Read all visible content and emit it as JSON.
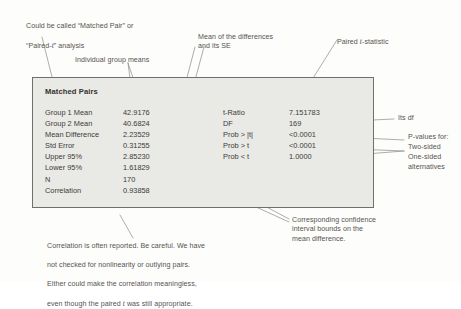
{
  "figure": {
    "box_title": "Matched Pairs",
    "left_table": {
      "rows": [
        {
          "label": "Group 1 Mean",
          "value": "42.9176"
        },
        {
          "label": "Group 2 Mean",
          "value": "40.6824"
        },
        {
          "label": "Mean Difference",
          "value": "2.23529"
        },
        {
          "label": "Std Error",
          "value": "0.31255"
        },
        {
          "label": "Upper 95%",
          "value": "2.85230"
        },
        {
          "label": "Lower 95%",
          "value": "1.61829"
        },
        {
          "label": "N",
          "value": "170"
        },
        {
          "label": "Correlation",
          "value": "0.93858"
        }
      ]
    },
    "right_table": {
      "rows": [
        {
          "label": "t-Ratio",
          "value": "7.151783"
        },
        {
          "label": "DF",
          "value": "169"
        },
        {
          "label": "Prob > |t|",
          "value": "<0.0001"
        },
        {
          "label": "Prob > t",
          "value": "<0.0001"
        },
        {
          "label": "Prob < t",
          "value": "1.0000"
        }
      ]
    }
  },
  "annotations": {
    "top_left": "Could be called “Matched Pair” or\n“Paired-t” analysis",
    "top_left_line1": "Could be called “Matched Pair” or",
    "top_left_line2a": "“Paired-",
    "top_left_line2b": "” analysis",
    "individual_group_means": "Individual group means",
    "mean_of_differences": "Mean of the differences\nand its SE",
    "paired_t_statistic_a": "Paired ",
    "paired_t_statistic_b": "-statistic",
    "its_df": "Its df",
    "p_values_for": "P-values for:",
    "two_sided": "Two-sided",
    "one_sided": "One-sided",
    "alternatives": "alternatives",
    "confidence_interval": "Corresponding confidence\ninterval bounds on the\nmean difference.",
    "correlation_note_line1": "Correlation is often reported. Be careful. We have",
    "correlation_note_line2": "not checked for nonlinearity or outlying pairs.",
    "correlation_note_line3": "Either could make the correlation meaningless,",
    "correlation_note_line4a": "even though the paired ",
    "correlation_note_line4b": " was still appropriate.",
    "italic_t": "t"
  },
  "colors": {
    "box_fill": "#e9e9e6",
    "box_border": "#6f6f6c",
    "text": "#3c3b38",
    "annotation_text": "#56544f",
    "leader_line": "#8a8986"
  }
}
